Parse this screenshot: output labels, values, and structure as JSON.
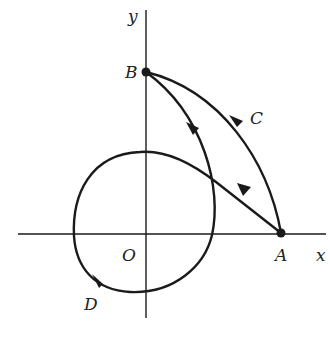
{
  "diagram": {
    "type": "line-integral-paths",
    "axes": {
      "x_label": "x",
      "y_label": "y",
      "origin_label": "O"
    },
    "points": [
      {
        "name": "A",
        "location": "on positive x-axis"
      },
      {
        "name": "B",
        "location": "on positive y-axis"
      }
    ],
    "curves": [
      {
        "label": "C",
        "from": "A",
        "to": "B",
        "description": "outer arc from A to B"
      },
      {
        "label": "D",
        "from": "A",
        "to": "B",
        "description": "path from A looping around origin then up to B"
      }
    ],
    "labels": {
      "A": "A",
      "B": "B",
      "C": "C",
      "D": "D",
      "O": "O",
      "x": "x",
      "y": "y"
    },
    "colors": {
      "stroke": "#1a1a1a",
      "background": "#ffffff"
    }
  }
}
